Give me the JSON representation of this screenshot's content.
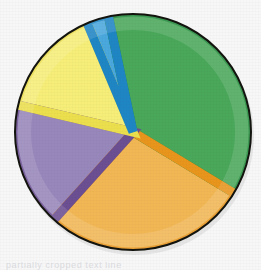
{
  "page": {
    "background_color": "#f7f7f8",
    "width": 261,
    "height": 270,
    "cropped_caption": "partially cropped text line"
  },
  "chart_data": {
    "type": "pie",
    "title": "",
    "subtitle": "",
    "xlabel": "",
    "ylabel": "",
    "grid": false,
    "legend_position": "none",
    "labels_shown": false,
    "start_angle_deg": -12,
    "direction": "clockwise",
    "center": {
      "x": 133,
      "y": 132
    },
    "radius": 118,
    "outline_color": "#14140f",
    "outline_width": 2,
    "rim_width": 9,
    "categories": [
      "Green",
      "Orange",
      "Purple",
      "Yellow",
      "Blue"
    ],
    "values": [
      37,
      28,
      17,
      15,
      3
    ],
    "slices": [
      {
        "name": "Green",
        "value": 37,
        "percent": 37,
        "start_deg": 0,
        "end_deg": 133.2,
        "color": "#4aa85a",
        "rim_color": "#228b3c"
      },
      {
        "name": "Orange",
        "value": 28,
        "percent": 28,
        "start_deg": 133.2,
        "end_deg": 234.0,
        "color": "#f2b755",
        "rim_color": "#e8951c"
      },
      {
        "name": "Purple",
        "value": 17,
        "percent": 17,
        "start_deg": 234.0,
        "end_deg": 295.2,
        "color": "#9887bb",
        "rim_color": "#6b4f92"
      },
      {
        "name": "Yellow",
        "value": 15,
        "percent": 15,
        "start_deg": 295.2,
        "end_deg": 349.2,
        "color": "#f6ee78",
        "rim_color": "#ecdf4e"
      },
      {
        "name": "Blue",
        "value": 3,
        "percent": 3,
        "start_deg": 349.2,
        "end_deg": 360,
        "color": "#4aa8dd",
        "rim_color": "#1f86c4"
      }
    ],
    "ylim": [
      0,
      100
    ]
  }
}
